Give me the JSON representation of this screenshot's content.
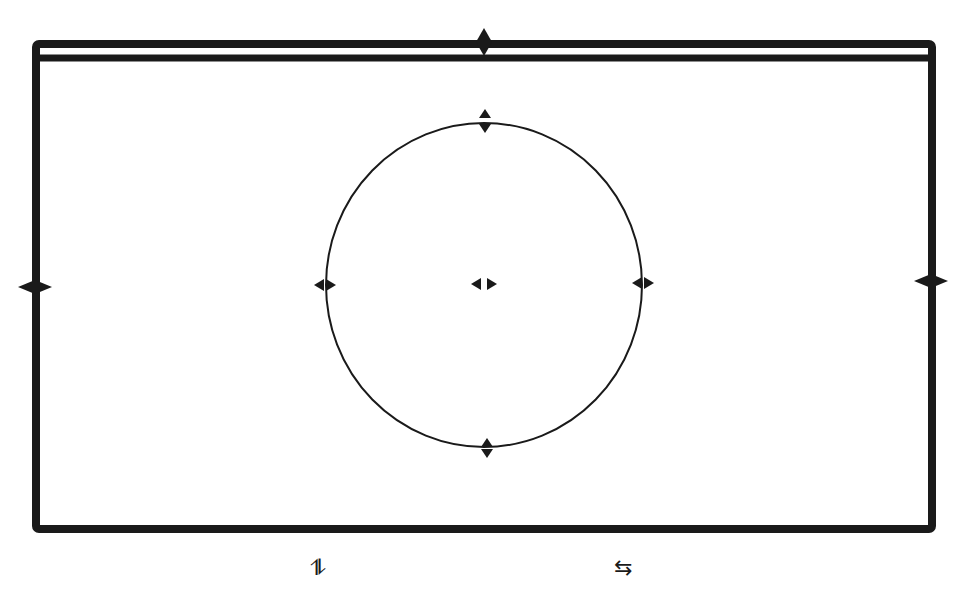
{
  "canvas": {
    "width": 955,
    "height": 612,
    "stroke_color": "#1a1a1a",
    "background": "#ffffff"
  },
  "frame": {
    "x": 36,
    "y": 44,
    "width": 896,
    "height": 485,
    "stroke_width": 8,
    "title_bar_inner_y": 58
  },
  "circle": {
    "cx": 484,
    "cy": 285,
    "rx": 158,
    "ry": 162,
    "stroke_width": 2
  },
  "handles": {
    "frame_top": {
      "x": 484,
      "y": 42
    },
    "frame_left": {
      "x": 35,
      "y": 287
    },
    "frame_right": {
      "x": 931,
      "y": 281
    },
    "circle_top": {
      "x": 485,
      "y": 121
    },
    "circle_bottom": {
      "x": 487,
      "y": 448
    },
    "circle_left": {
      "x": 325,
      "y": 285
    },
    "circle_right": {
      "x": 643,
      "y": 283
    },
    "circle_center": {
      "x": 484,
      "y": 284
    }
  },
  "bottom_icons": {
    "vertical_swap": {
      "glyph": "⥮",
      "x": 318,
      "y": 568,
      "semantic": "vertical-swap-arrows-icon"
    },
    "horizontal_swap": {
      "glyph": "⇆",
      "x": 624,
      "y": 568,
      "semantic": "horizontal-swap-arrows-icon"
    }
  }
}
